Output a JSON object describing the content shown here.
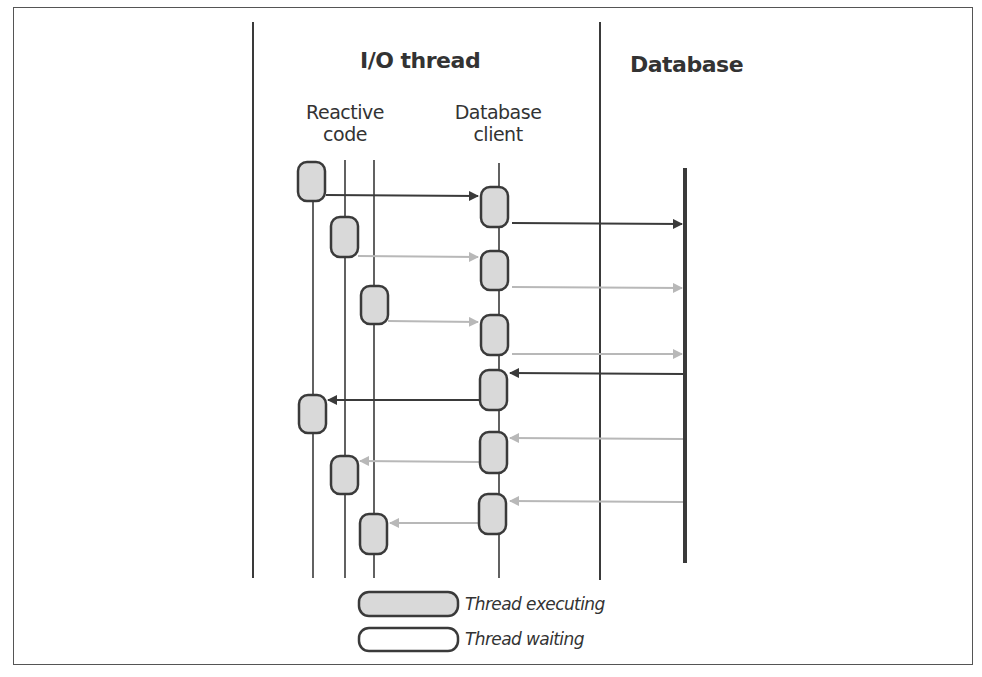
{
  "diagram": {
    "sections": {
      "io_thread": "I/O thread",
      "database": "Database"
    },
    "lanes": {
      "reactive_code": [
        "Reactive",
        "code"
      ],
      "database_client": [
        "Database",
        "client"
      ]
    },
    "legend": {
      "executing": "Thread executing",
      "waiting": "Thread waiting"
    },
    "colors": {
      "stroke": "#3a3a3a",
      "executing_fill": "#d9d9d9",
      "faded_arrow": "#b8b8b8",
      "strong_arrow": "#3a3a3a"
    },
    "events": [
      {
        "from": "reactive-1",
        "to": "db-client",
        "style": "strong"
      },
      {
        "from": "db-client",
        "to": "database",
        "style": "strong"
      },
      {
        "from": "reactive-2",
        "to": "db-client",
        "style": "faded"
      },
      {
        "from": "db-client",
        "to": "database",
        "style": "faded"
      },
      {
        "from": "reactive-3",
        "to": "db-client",
        "style": "faded"
      },
      {
        "from": "db-client",
        "to": "database",
        "style": "faded"
      },
      {
        "from": "database",
        "to": "db-client",
        "style": "strong"
      },
      {
        "from": "db-client",
        "to": "reactive-1",
        "style": "strong"
      },
      {
        "from": "database",
        "to": "db-client",
        "style": "faded"
      },
      {
        "from": "db-client",
        "to": "reactive-2",
        "style": "faded"
      },
      {
        "from": "database",
        "to": "db-client",
        "style": "faded"
      },
      {
        "from": "db-client",
        "to": "reactive-3",
        "style": "faded"
      }
    ]
  }
}
